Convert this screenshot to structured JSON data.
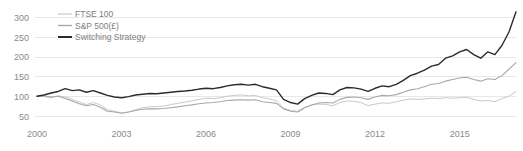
{
  "chart_data": {
    "type": "line",
    "title": "",
    "subtitle": "",
    "xlabel": "",
    "ylabel": "",
    "xlim": [
      2000,
      2017
    ],
    "ylim": [
      50,
      310
    ],
    "grid": true,
    "grid_axis": "y",
    "legend_position": "top-left",
    "x_ticks": [
      "2000",
      "2003",
      "2006",
      "2009",
      "2012",
      "2015"
    ],
    "x_tick_values": [
      2000,
      2003,
      2006,
      2009,
      2012,
      2015
    ],
    "y_ticks": [
      "50",
      "100",
      "150",
      "200",
      "250",
      "300"
    ],
    "y_tick_values": [
      50,
      100,
      150,
      200,
      250,
      300
    ],
    "x": [
      2000.0,
      2000.25,
      2000.5,
      2000.75,
      2001.0,
      2001.25,
      2001.5,
      2001.75,
      2002.0,
      2002.25,
      2002.5,
      2002.75,
      2003.0,
      2003.25,
      2003.5,
      2003.75,
      2004.0,
      2004.25,
      2004.5,
      2004.75,
      2005.0,
      2005.25,
      2005.5,
      2005.75,
      2006.0,
      2006.25,
      2006.5,
      2006.75,
      2007.0,
      2007.25,
      2007.5,
      2007.75,
      2008.0,
      2008.25,
      2008.5,
      2008.75,
      2009.0,
      2009.25,
      2009.5,
      2009.75,
      2010.0,
      2010.25,
      2010.5,
      2010.75,
      2011.0,
      2011.25,
      2011.5,
      2011.75,
      2012.0,
      2012.25,
      2012.5,
      2012.75,
      2013.0,
      2013.25,
      2013.5,
      2013.75,
      2014.0,
      2014.25,
      2014.5,
      2014.75,
      2015.0,
      2015.25,
      2015.5,
      2015.75,
      2016.0,
      2016.25,
      2016.5,
      2016.75,
      2017.0
    ],
    "series": [
      {
        "name": "FTSE 100",
        "color": "#c9c9c9",
        "linewidth": 1.0,
        "values": [
          100,
          99,
          96,
          101,
          98,
          92,
          85,
          79,
          84,
          78,
          66,
          62,
          58,
          60,
          66,
          71,
          73,
          74,
          75,
          79,
          82,
          85,
          88,
          92,
          95,
          94,
          96,
          100,
          102,
          103,
          101,
          102,
          96,
          93,
          88,
          70,
          64,
          62,
          72,
          78,
          80,
          79,
          76,
          84,
          88,
          87,
          84,
          76,
          80,
          83,
          82,
          86,
          90,
          93,
          92,
          93,
          95,
          94,
          96,
          95,
          96,
          97,
          92,
          88,
          89,
          86,
          94,
          100,
          112
        ]
      },
      {
        "name": "S&P 500(£)",
        "color": "#a8a8a8",
        "linewidth": 1.1,
        "values": [
          100,
          101,
          98,
          100,
          94,
          88,
          81,
          76,
          79,
          72,
          62,
          60,
          57,
          60,
          64,
          67,
          68,
          68,
          69,
          71,
          73,
          76,
          78,
          81,
          83,
          84,
          86,
          89,
          90,
          91,
          90,
          91,
          86,
          84,
          82,
          68,
          62,
          60,
          71,
          78,
          83,
          84,
          83,
          92,
          97,
          98,
          96,
          92,
          98,
          102,
          101,
          104,
          110,
          116,
          119,
          124,
          130,
          132,
          138,
          142,
          146,
          148,
          142,
          138,
          144,
          142,
          152,
          168,
          185
        ]
      },
      {
        "name": "Switching Strategy",
        "color": "#2b2b2b",
        "linewidth": 1.4,
        "values": [
          100,
          103,
          108,
          112,
          119,
          114,
          116,
          110,
          114,
          108,
          102,
          98,
          96,
          99,
          103,
          105,
          107,
          106,
          108,
          110,
          112,
          113,
          115,
          118,
          120,
          119,
          122,
          126,
          129,
          130,
          128,
          130,
          124,
          120,
          116,
          92,
          84,
          80,
          94,
          102,
          108,
          107,
          104,
          116,
          122,
          121,
          118,
          112,
          120,
          126,
          124,
          130,
          140,
          152,
          158,
          166,
          176,
          180,
          196,
          202,
          212,
          218,
          205,
          196,
          212,
          205,
          228,
          262,
          313
        ]
      }
    ]
  },
  "legend": {
    "items": [
      {
        "label": "FTSE 100",
        "color": "#c9c9c9"
      },
      {
        "label": "S&P 500(£)",
        "color": "#a8a8a8"
      },
      {
        "label": "Switching Strategy",
        "color": "#2b2b2b"
      }
    ]
  },
  "style": {
    "background": "#ffffff",
    "gridline_color": "#e2e2e2",
    "tick_label_color": "#8a8a8a",
    "legend_label_color": "#7d7d7d"
  }
}
